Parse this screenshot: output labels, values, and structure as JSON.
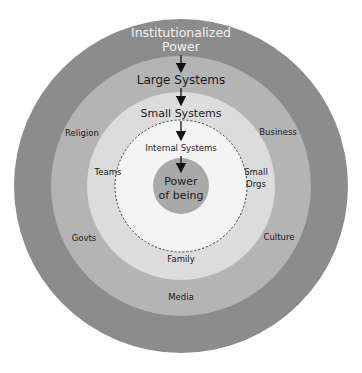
{
  "rings": {
    "outer": {
      "title_line1": "Institutionalized",
      "title_line2": "Power",
      "color": "#8c8c8c",
      "title_color": "#f2f2f2"
    },
    "large": {
      "title": "Large Systems",
      "color": "#b4b4b4",
      "labels": [
        "Religion",
        "Business",
        "Govts",
        "Culture",
        "Media"
      ]
    },
    "small": {
      "title": "Small Systems",
      "color": "#dcdcdc",
      "labels": [
        "Teams",
        "Small",
        "Orgs",
        "Family"
      ]
    },
    "internal": {
      "title": "Internal Systems",
      "color": "#f4f4f4"
    },
    "core": {
      "title_line1": "Power",
      "title_line2": "of being",
      "color": "#a9a9a9"
    }
  }
}
